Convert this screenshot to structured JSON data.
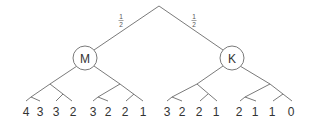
{
  "diagram": {
    "type": "game-tree",
    "root": {
      "x": 159,
      "y": 6
    },
    "branch_probabilities": [
      {
        "numerator": "1",
        "denominator": "2",
        "side": "left"
      },
      {
        "numerator": "1",
        "denominator": "2",
        "side": "right"
      }
    ],
    "players": [
      {
        "id": "M",
        "label": "M"
      },
      {
        "id": "K",
        "label": "K"
      }
    ],
    "leaves": {
      "M": [
        "4",
        "3",
        "3",
        "2",
        "3",
        "2",
        "2",
        "1"
      ],
      "K": [
        "3",
        "2",
        "2",
        "1",
        "2",
        "1",
        "1",
        "0"
      ]
    },
    "colors": {
      "line": "#6b6b6b",
      "text": "#333333",
      "background": "#ffffff"
    }
  }
}
